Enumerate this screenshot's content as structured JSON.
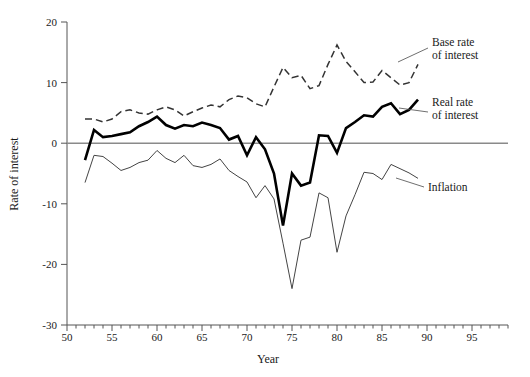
{
  "chart_data": {
    "type": "line",
    "title": "",
    "xlabel": "Year",
    "ylabel": "Rate of interest",
    "xlim": [
      50,
      99
    ],
    "ylim": [
      -30,
      20
    ],
    "grid": false,
    "legend_position": "inline-right",
    "x_major_ticks": [
      50,
      55,
      60,
      65,
      70,
      75,
      80,
      85,
      90,
      95
    ],
    "x_major_tick_labels": [
      "50",
      "55",
      "60",
      "65",
      "70",
      "75",
      "80",
      "85",
      "90",
      "95"
    ],
    "x_minor_tick_step": 1,
    "y_ticks": [
      20,
      10,
      0,
      -10,
      -20,
      -30
    ],
    "y_tick_labels": [
      "20",
      "10",
      "0",
      "-10",
      "-20",
      "-30"
    ],
    "series": [
      {
        "name": "Base rate of interest",
        "label_line1": "Base rate",
        "label_line2": "of interest",
        "style": "dashed",
        "color": "#333333",
        "width": 1.5,
        "x": [
          52,
          53,
          54,
          55,
          56,
          57,
          58,
          59,
          60,
          61,
          62,
          63,
          64,
          65,
          66,
          67,
          68,
          69,
          70,
          71,
          72,
          73,
          74,
          75,
          76,
          77,
          78,
          79,
          80,
          81,
          82,
          83,
          84,
          85,
          86,
          87,
          88,
          89
        ],
        "values": [
          4.0,
          4.0,
          3.5,
          4.0,
          5.2,
          5.5,
          5.0,
          4.8,
          5.5,
          6.0,
          5.5,
          4.5,
          5.2,
          5.8,
          6.3,
          6.0,
          7.2,
          7.8,
          7.5,
          6.5,
          6.0,
          9.3,
          12.5,
          10.8,
          11.2,
          9.0,
          9.5,
          13.0,
          16.2,
          13.5,
          11.8,
          10.0,
          10.1,
          12.0,
          10.8,
          9.6,
          10.0,
          13.0
        ]
      },
      {
        "name": "Real rate of interest",
        "label_line1": "Real rate",
        "label_line2": "of interest",
        "style": "solid-thick",
        "color": "#000000",
        "width": 2.6,
        "x": [
          52,
          53,
          54,
          55,
          56,
          57,
          58,
          59,
          60,
          61,
          62,
          63,
          64,
          65,
          66,
          67,
          68,
          69,
          70,
          71,
          72,
          73,
          74,
          75,
          76,
          77,
          78,
          79,
          80,
          81,
          82,
          83,
          84,
          85,
          86,
          87,
          88,
          89
        ],
        "values": [
          -2.8,
          2.2,
          1.0,
          1.2,
          1.5,
          1.8,
          2.8,
          3.5,
          4.4,
          3.0,
          2.4,
          3.0,
          2.8,
          3.4,
          3.0,
          2.5,
          0.6,
          1.2,
          -2.0,
          1.0,
          -1.0,
          -5.0,
          -13.6,
          -5.0,
          -7.0,
          -6.5,
          1.3,
          1.2,
          -1.6,
          2.5,
          3.5,
          4.6,
          4.4,
          6.0,
          6.6,
          4.8,
          5.5,
          7.2
        ]
      },
      {
        "name": "Inflation",
        "label_line1": "Inflation",
        "label_line2": "",
        "style": "solid-thin",
        "color": "#444444",
        "width": 1.0,
        "x": [
          52,
          53,
          54,
          55,
          56,
          57,
          58,
          59,
          60,
          61,
          62,
          63,
          64,
          65,
          66,
          67,
          68,
          69,
          70,
          71,
          72,
          73,
          74,
          75,
          76,
          77,
          78,
          79,
          80,
          81,
          82,
          83,
          84,
          85,
          86,
          87,
          88,
          89
        ],
        "values": [
          -6.5,
          -2.0,
          -2.2,
          -3.3,
          -4.5,
          -4.0,
          -3.2,
          -2.8,
          -1.2,
          -2.5,
          -3.2,
          -2.0,
          -3.7,
          -4.0,
          -3.5,
          -2.6,
          -4.5,
          -5.5,
          -6.4,
          -9.0,
          -7.0,
          -9.2,
          -16.5,
          -24.0,
          -16.0,
          -15.5,
          -8.2,
          -9.0,
          -18.0,
          -12.0,
          -8.5,
          -4.8,
          -5.0,
          -6.0,
          -3.5,
          -4.2,
          -4.9,
          -5.8
        ]
      }
    ]
  },
  "labels": {
    "base_rate_l1": "Base rate",
    "base_rate_l2": "of interest",
    "real_rate_l1": "Real rate",
    "real_rate_l2": "of interest",
    "inflation": "Inflation",
    "y_axis_title": "Rate of interest",
    "x_axis_title": "Year"
  },
  "y_tick_text": {
    "t20": "20",
    "t10": "10",
    "t0": "0",
    "tm10": "-10",
    "tm20": "-20",
    "tm30": "-30"
  },
  "x_tick_text": {
    "t50": "50",
    "t55": "55",
    "t60": "60",
    "t65": "65",
    "t70": "70",
    "t75": "75",
    "t80": "80",
    "t85": "85",
    "t90": "90",
    "t95": "95"
  }
}
